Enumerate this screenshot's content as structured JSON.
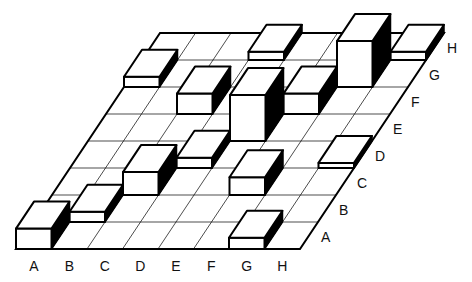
{
  "chart_data": {
    "type": "bar3d",
    "title": "",
    "x_axis": {
      "label": "",
      "categories": [
        "A",
        "B",
        "C",
        "D",
        "E",
        "F",
        "G",
        "H"
      ]
    },
    "y_axis": {
      "label": "",
      "categories": [
        "A",
        "B",
        "C",
        "D",
        "E",
        "F",
        "G",
        "H"
      ]
    },
    "z_unit": "relative height",
    "grid": true,
    "bars": [
      {
        "x": "A",
        "y": "A",
        "height": 4
      },
      {
        "x": "B",
        "y": "B",
        "height": 2
      },
      {
        "x": "C",
        "y": "C",
        "height": 4.5
      },
      {
        "x": "D",
        "y": "D",
        "height": 2
      },
      {
        "x": "F",
        "y": "C",
        "height": 3.5
      },
      {
        "x": "G",
        "y": "A",
        "height": 2.2
      },
      {
        "x": "H",
        "y": "D",
        "height": 1
      },
      {
        "x": "C",
        "y": "F",
        "height": 4
      },
      {
        "x": "E",
        "y": "E",
        "height": 9
      },
      {
        "x": "F",
        "y": "F",
        "height": 4
      },
      {
        "x": "A",
        "y": "G",
        "height": 2
      },
      {
        "x": "D",
        "y": "H",
        "height": 1.6
      },
      {
        "x": "G",
        "y": "G",
        "height": 9
      },
      {
        "x": "H",
        "y": "H",
        "height": 1.6
      }
    ]
  },
  "colors": {
    "line": "#000000",
    "face": "#ffffff",
    "side": "#000000"
  }
}
